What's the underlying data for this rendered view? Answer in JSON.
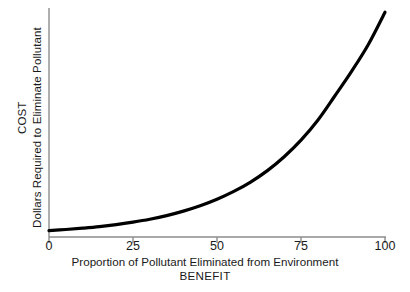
{
  "figure": {
    "background_color": "#ffffff",
    "curve_color": "#000000",
    "axis_color": "#8c8c8c",
    "text_color": "#1a1a1a"
  },
  "yaxis": {
    "title_outer": "COST",
    "title_inner": "Dollars Required to Eliminate Pollutant"
  },
  "xaxis": {
    "caption_line1": "Proportion of Pollutant Eliminated from Environment",
    "caption_line2": "BENEFIT",
    "tick_labels": [
      "0",
      "25",
      "50",
      "75",
      "100"
    ]
  },
  "bottom_remnant": {
    "text": "clipped caption line"
  },
  "chart_data": {
    "type": "line",
    "title": "",
    "subtitle": "",
    "xlabel": "Proportion of Pollutant Eliminated from Environment / BENEFIT",
    "ylabel": "COST / Dollars Required to Eliminate Pollutant",
    "xlim": [
      0,
      100
    ],
    "ylim": [
      0,
      100
    ],
    "xticks": [
      0,
      25,
      50,
      75,
      100
    ],
    "xticklabels": [
      "0",
      "25",
      "50",
      "75",
      "100"
    ],
    "yticks": [],
    "yticklabels": [],
    "grid": false,
    "legend": false,
    "legend_position": "none",
    "annotations": [],
    "series": [
      {
        "name": "Cost to eliminate pollutant",
        "color": "#000000",
        "linewidth": 3.2,
        "x": [
          0,
          5,
          10,
          15,
          20,
          25,
          30,
          35,
          40,
          45,
          50,
          55,
          60,
          65,
          70,
          75,
          80,
          85,
          90,
          95,
          100
        ],
        "y": [
          1.5,
          2.0,
          2.6,
          3.3,
          4.2,
          5.3,
          6.6,
          8.2,
          10.2,
          12.6,
          15.5,
          19.0,
          23.2,
          28.3,
          34.5,
          41.9,
          50.8,
          61.5,
          72.5,
          84.5,
          99.0
        ]
      }
    ]
  }
}
